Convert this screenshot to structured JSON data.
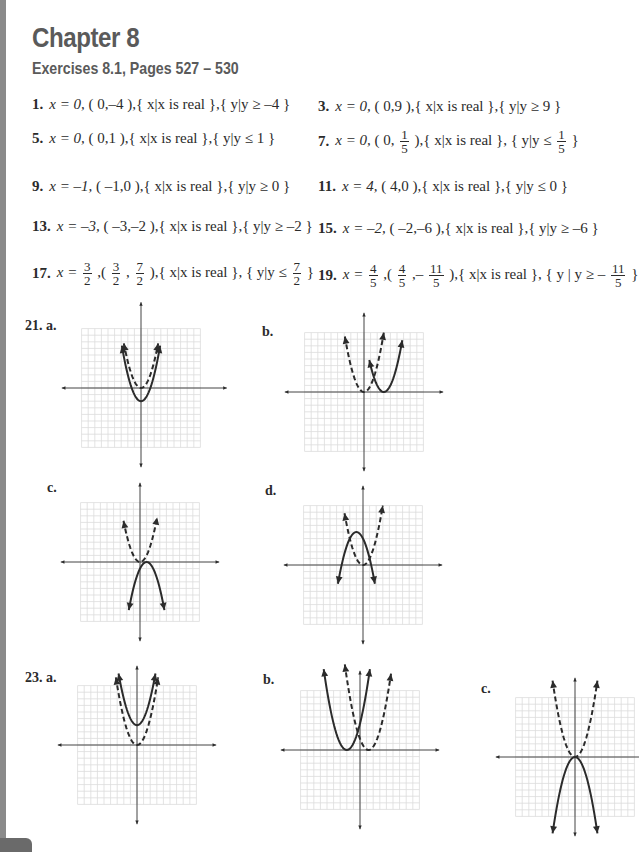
{
  "header": {
    "chapter": "Chapter 8",
    "subtitle": "Exercises 8.1, Pages 527 – 530"
  },
  "answers": [
    {
      "num": "1.",
      "axis": "x = 0,",
      "vertex": "( 0,–4 ),",
      "domain": "{ x|x is real },",
      "range": "{ y|y ≥ –4 }"
    },
    {
      "num": "3.",
      "axis": "x = 0,",
      "vertex": "( 0,9 ),",
      "domain": "{ x|x is real },",
      "range": "{ y|y ≥ 9 }"
    },
    {
      "num": "5.",
      "axis": "x = 0,",
      "vertex": "( 0,1 ),",
      "domain": "{ x|x is real },",
      "range": "{ y|y ≤ 1 }"
    },
    {
      "num": "7.",
      "axis": "x = 0,",
      "vertex_pre": "( 0,",
      "vertex_frac": {
        "n": "1",
        "d": "5"
      },
      "vertex_post": "),",
      "domain": "{ x|x is real },",
      "range_pre": "{ y|y ≤",
      "range_frac": {
        "n": "1",
        "d": "5"
      },
      "range_post": "}"
    },
    {
      "num": "9.",
      "axis": "x = –1,",
      "vertex": "( –1,0 ),",
      "domain": "{ x|x is real },",
      "range": "{ y|y ≥ 0 }"
    },
    {
      "num": "11.",
      "axis": "x = 4,",
      "vertex": "( 4,0 ),",
      "domain": "{ x|x is real },",
      "range": "{ y|y ≤ 0 }"
    },
    {
      "num": "13.",
      "axis": "x = –3,",
      "vertex": "( –3,–2 ),",
      "domain": "{ x|x is real },",
      "range": "{ y|y ≥ –2 }"
    },
    {
      "num": "15.",
      "axis": "x = –2,",
      "vertex": "( –2,–6 ),",
      "domain": "{ x|x is real },",
      "range": "{ y|y ≥ –6 }"
    },
    {
      "num": "17.",
      "axis_pre": "x =",
      "axis_frac": {
        "n": "3",
        "d": "2"
      },
      "vertex_pre": ",(",
      "vertex_frac1": {
        "n": "3",
        "d": "2"
      },
      "vertex_mid": ",",
      "vertex_frac2": {
        "n": "7",
        "d": "2"
      },
      "vertex_post": "),",
      "domain": "{ x|x is real },",
      "range_pre": "{ y|y ≤",
      "range_frac": {
        "n": "7",
        "d": "2"
      },
      "range_post": "}"
    },
    {
      "num": "19.",
      "axis_pre": "x =",
      "axis_frac": {
        "n": "4",
        "d": "5"
      },
      "vertex_pre": ",(",
      "vertex_frac1": {
        "n": "4",
        "d": "5"
      },
      "vertex_mid": ",–",
      "vertex_frac2": {
        "n": "11",
        "d": "5"
      },
      "vertex_post": "),",
      "domain": "{ x|x is real },",
      "range_pre": "{ y | y ≥ –",
      "range_frac": {
        "n": "11",
        "d": "5"
      },
      "range_post": "}"
    }
  ],
  "graphs": [
    {
      "label": "21. a.",
      "cx": 141,
      "cy": 388,
      "unit": 6.6,
      "grid": [
        -9,
        9,
        -9,
        9
      ],
      "axes": [
        -12,
        13,
        -12,
        13
      ],
      "curves": [
        {
          "a": 1,
          "h": 0,
          "k": -2,
          "x": [
            -2.9,
            2.9
          ],
          "dashed": false
        },
        {
          "a": 1,
          "h": 0,
          "k": 0,
          "x": [
            -2.6,
            2.6
          ],
          "dashed": true
        }
      ]
    },
    {
      "label": "b.",
      "cx": 364,
      "cy": 392,
      "unit": 6.6,
      "grid": [
        -9,
        9,
        -9,
        9
      ],
      "axes": [
        -12,
        12,
        -12,
        12
      ],
      "curves": [
        {
          "a": 1,
          "h": 3,
          "k": 0,
          "x": [
            0.8,
            5.8
          ],
          "dashed": false
        },
        {
          "a": 1,
          "h": 0,
          "k": 0,
          "x": [
            -2.9,
            3
          ],
          "dashed": true
        }
      ]
    },
    {
      "label": "c.",
      "cx": 140,
      "cy": 562,
      "unit": 6.6,
      "grid": [
        -9,
        9,
        -9,
        9
      ],
      "axes": [
        -12,
        12,
        -12,
        12
      ],
      "curves": [
        {
          "a": -1,
          "h": 1,
          "k": 0,
          "x": [
            -1.7,
            3.7
          ],
          "dashed": false
        },
        {
          "a": 1,
          "h": 0,
          "k": 0,
          "x": [
            -2.5,
            2.6
          ],
          "dashed": true
        }
      ]
    },
    {
      "label": "d.",
      "cx": 363,
      "cy": 565,
      "unit": 6.6,
      "grid": [
        -9,
        9,
        -9,
        9
      ],
      "axes": [
        -12,
        12,
        -12,
        12
      ],
      "curves": [
        {
          "a": -1,
          "h": -1,
          "k": 5,
          "x": [
            -3.8,
            1.8
          ],
          "dashed": false
        },
        {
          "a": 1,
          "h": 0,
          "k": 0,
          "x": [
            -2.8,
            3
          ],
          "dashed": true
        }
      ]
    },
    {
      "label": "23. a.",
      "cx": 137,
      "cy": 745,
      "unit": 6.6,
      "grid": [
        -9,
        9,
        -9,
        9
      ],
      "axes": [
        -12,
        12,
        -12,
        12
      ],
      "curves": [
        {
          "a": 1,
          "h": 0,
          "k": 3,
          "x": [
            -2.8,
            2.8
          ],
          "dashed": false
        },
        {
          "a": 1,
          "h": 0,
          "k": 0,
          "x": [
            -3.2,
            3.2
          ],
          "dashed": true
        }
      ]
    },
    {
      "label": "b.",
      "cx": 360,
      "cy": 750,
      "unit": 6.6,
      "grid": [
        -9,
        9,
        -9,
        9
      ],
      "axes": [
        -12,
        12,
        -12,
        12
      ],
      "curves": [
        {
          "a": 1,
          "h": -2,
          "k": 0,
          "x": [
            -5.5,
            1.5
          ],
          "dashed": false
        },
        {
          "a": 1,
          "h": 1.3,
          "k": 0,
          "x": [
            -2.3,
            4.7
          ],
          "dashed": true
        }
      ]
    },
    {
      "label": "c.",
      "cx": 575,
      "cy": 757,
      "unit": 6.6,
      "grid": [
        -9,
        9,
        -9,
        9
      ],
      "axes": [
        -12,
        12,
        -12,
        12
      ],
      "curves": [
        {
          "a": -1,
          "h": 0,
          "k": 0,
          "x": [
            -3.4,
            3.4
          ],
          "dashed": false
        },
        {
          "a": 1,
          "h": 0,
          "k": 0,
          "x": [
            -3.4,
            3.4
          ],
          "dashed": true
        }
      ]
    }
  ],
  "graph_label_positions": [
    {
      "x": 25,
      "y": 324
    },
    {
      "x": 262,
      "y": 324
    },
    {
      "x": 47,
      "y": 480
    },
    {
      "x": 265,
      "y": 485
    },
    {
      "x": 25,
      "y": 670
    },
    {
      "x": 263,
      "y": 672
    },
    {
      "x": 481,
      "y": 681
    }
  ],
  "colors": {
    "ink": "#2b2b2b",
    "grid": "#dcdcdc",
    "heading": "#5a5a5a",
    "edge": "#8a8a8a"
  }
}
